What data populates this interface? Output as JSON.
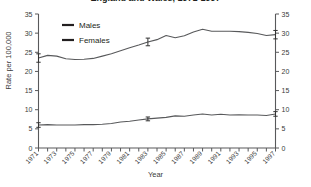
{
  "chart_data": {
    "type": "line",
    "title": "England and Wales, 1971-1997",
    "xlabel": "Year",
    "ylabel": "Rate per 100,000",
    "xlim": [
      1971,
      1997
    ],
    "ylim": [
      0,
      35
    ],
    "yticks": [
      0,
      5,
      10,
      15,
      20,
      25,
      30,
      35
    ],
    "ytick_labels": [
      "0",
      "5",
      "10",
      "15",
      "20",
      "25",
      "30",
      "35"
    ],
    "dual_y_axis": true,
    "grid": false,
    "legend_position": "top-left",
    "x": [
      1971,
      1972,
      1973,
      1974,
      1975,
      1976,
      1977,
      1978,
      1979,
      1980,
      1981,
      1982,
      1983,
      1984,
      1985,
      1986,
      1987,
      1988,
      1989,
      1990,
      1991,
      1992,
      1993,
      1994,
      1995,
      1996,
      1997
    ],
    "xtick_labels": [
      "1971",
      "1973",
      "1975",
      "1977",
      "1979",
      "1981",
      "1983",
      "1985",
      "1987",
      "1989",
      "1991",
      "1993",
      "1995",
      "1997"
    ],
    "xtick_years": [
      1971,
      1973,
      1975,
      1977,
      1979,
      1981,
      1983,
      1985,
      1987,
      1989,
      1991,
      1993,
      1995,
      1997
    ],
    "series": [
      {
        "name": "Males",
        "color": "#58595b",
        "values": [
          23.5,
          24.2,
          24.0,
          23.3,
          23.1,
          23.2,
          23.4,
          24.0,
          24.6,
          25.4,
          26.2,
          26.9,
          27.7,
          28.3,
          29.4,
          28.8,
          29.3,
          30.3,
          31.0,
          30.5,
          30.5,
          30.5,
          30.4,
          30.2,
          29.9,
          29.4,
          29.6
        ],
        "error_bar_years": [
          1971,
          1983,
          1997
        ],
        "error_bar_values": [
          23.5,
          27.7,
          29.6
        ],
        "error_bar_halfwidth": [
          1.1,
          1.0,
          1.1
        ]
      },
      {
        "name": "Females",
        "color": "#58595b",
        "values": [
          6.0,
          6.1,
          6.0,
          6.0,
          6.0,
          6.1,
          6.1,
          6.2,
          6.4,
          6.8,
          7.0,
          7.3,
          7.6,
          7.8,
          8.0,
          8.4,
          8.3,
          8.6,
          8.9,
          8.6,
          8.8,
          8.6,
          8.7,
          8.6,
          8.6,
          8.5,
          8.9
        ],
        "error_bar_years": [
          1971,
          1983,
          1997
        ],
        "error_bar_values": [
          6.0,
          7.6,
          8.9
        ],
        "error_bar_halfwidth": [
          0.6,
          0.5,
          0.6
        ]
      }
    ],
    "legend": [
      {
        "label": "Males",
        "color": "#231f20"
      },
      {
        "label": "Females",
        "color": "#231f20"
      }
    ]
  }
}
